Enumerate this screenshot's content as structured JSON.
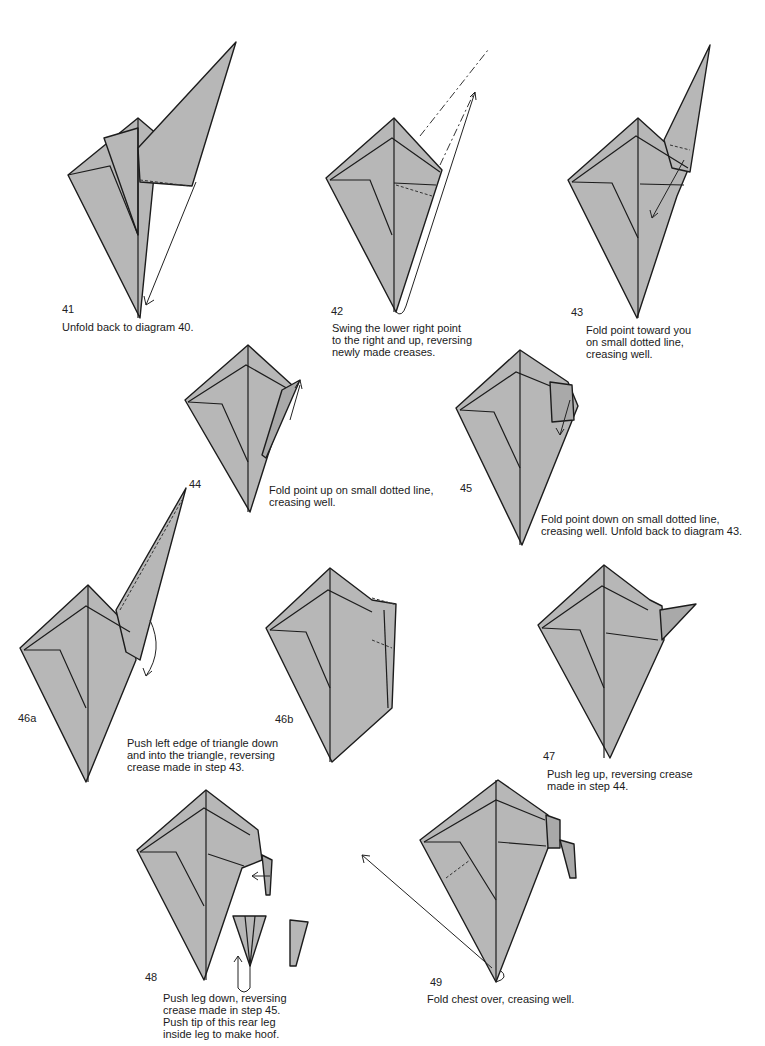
{
  "page": {
    "paper_color": "#b7b7b7",
    "line_color": "#1c1c1c"
  },
  "steps": [
    {
      "number": "41",
      "caption": "Unfold back to diagram 40."
    },
    {
      "number": "42",
      "caption": "Swing the lower right point\nto the right and up, reversing\nnewly made creases."
    },
    {
      "number": "43",
      "caption": "Fold point toward you\non small dotted line,\ncreasing well."
    },
    {
      "number": "44",
      "caption": "Fold point up on small dotted line,\ncreasing well."
    },
    {
      "number": "45",
      "caption": "Fold point down on small dotted line,\ncreasing well. Unfold back to diagram 43."
    },
    {
      "number": "46a",
      "caption": "Push left edge of triangle down\nand into the triangle, reversing\ncrease made in step 43."
    },
    {
      "number": "46b",
      "caption": ""
    },
    {
      "number": "47",
      "caption": "Push leg up, reversing crease\nmade in step 44."
    },
    {
      "number": "48",
      "caption": "Push leg down, reversing\ncrease made in step 45.\nPush tip of this rear leg\ninside leg to make hoof."
    },
    {
      "number": "49",
      "caption": "Fold chest over, creasing well."
    }
  ]
}
